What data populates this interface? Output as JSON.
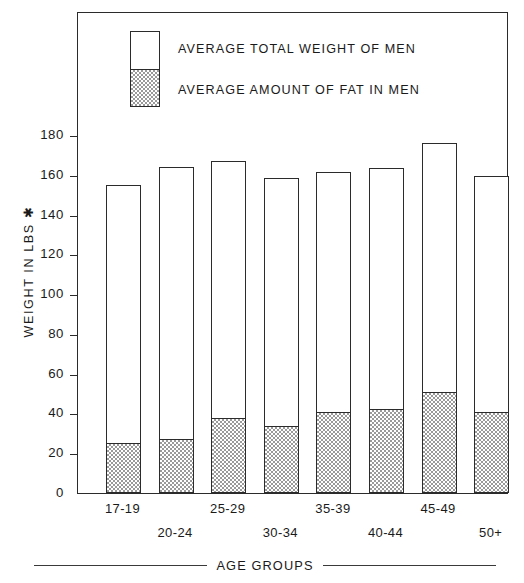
{
  "chart_data": {
    "type": "bar",
    "title": "",
    "subtitle": "",
    "xlabel": "AGE GROUPS",
    "ylabel": "WEIGHT IN LBS ✱",
    "categories": [
      "17-19",
      "20-24",
      "25-29",
      "30-34",
      "35-39",
      "40-44",
      "45-49",
      "50+"
    ],
    "series": [
      {
        "name": "AVERAGE TOTAL WEIGHT OF MEN",
        "values": [
          155,
          164,
          167,
          158.5,
          161.5,
          163.5,
          176,
          159.5
        ]
      },
      {
        "name": "AVERAGE AMOUNT OF FAT IN MEN",
        "values": [
          24.5,
          26.5,
          37,
          33,
          40,
          42,
          50.5,
          40
        ]
      }
    ],
    "stacked": true,
    "ylim": [
      0,
      200
    ],
    "ytick_values": [
      0,
      20,
      40,
      60,
      80,
      100,
      120,
      140,
      160,
      180
    ],
    "ytick_labels": [
      "0",
      "20",
      "40",
      "60",
      "80",
      "100",
      "120",
      "140",
      "160",
      "180"
    ],
    "grid": false,
    "legend_position": "top-left-inside",
    "colors": {
      "total_fill": "#ffffff",
      "fat_fill": "#9a9a9a",
      "outline": "#2b2b2b",
      "text": "#1a1a1a"
    }
  },
  "legend": {
    "total_label": "AVERAGE TOTAL WEIGHT OF MEN",
    "fat_label": "AVERAGE AMOUNT OF FAT IN MEN"
  },
  "axes": {
    "y_title": "WEIGHT IN LBS ✱",
    "x_title": "AGE GROUPS"
  }
}
